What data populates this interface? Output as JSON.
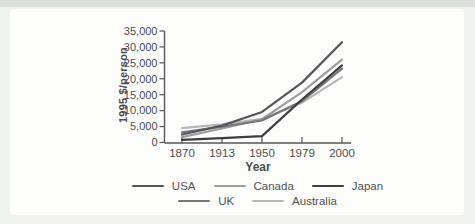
{
  "chart_data": {
    "type": "line",
    "title": "",
    "xlabel": "Year",
    "ylabel": "1995 $/person",
    "x_categories": [
      "1870",
      "1913",
      "1950",
      "1979",
      "2000"
    ],
    "ylim": [
      0,
      35000
    ],
    "y_tick_interval": 5000,
    "y_tick_labels": [
      "0",
      "5,000",
      "10,000",
      "15,000",
      "20,000",
      "25,000",
      "30,000",
      "35,000"
    ],
    "grid": false,
    "axis_color": "#55565a",
    "legend_position": "bottom",
    "legend_rows": [
      [
        "USA",
        "Canada",
        "Japan"
      ],
      [
        "UK",
        "Australia"
      ]
    ],
    "series": [
      {
        "name": "USA",
        "color": "#55565a",
        "values": [
          2500,
          5300,
          9600,
          18800,
          31500
        ]
      },
      {
        "name": "Canada",
        "color": "#9b9da0",
        "values": [
          1700,
          4400,
          7300,
          15800,
          26000
        ]
      },
      {
        "name": "Japan",
        "color": "#3e3e40",
        "values": [
          800,
          1400,
          2000,
          13500,
          24200
        ]
      },
      {
        "name": "UK",
        "color": "#76777a",
        "values": [
          3200,
          5000,
          6900,
          13000,
          23200
        ]
      },
      {
        "name": "Australia",
        "color": "#b5b7b9",
        "values": [
          4500,
          5700,
          7400,
          12500,
          20500
        ]
      }
    ]
  }
}
